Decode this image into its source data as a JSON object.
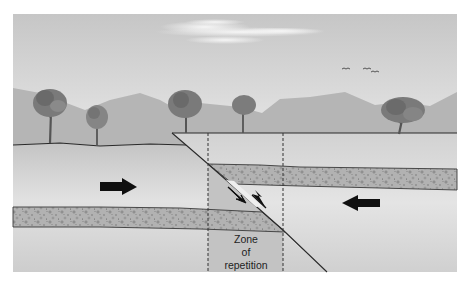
{
  "diagram": {
    "labels": {
      "zone_line1": "Zone",
      "zone_line2": "of",
      "zone_line3": "repetition"
    },
    "arrows": [
      {
        "name": "compression-arrow-right",
        "direction": "right"
      },
      {
        "name": "compression-arrow-left",
        "direction": "left"
      }
    ],
    "fault_motion_arrows": [
      "down-left (lower block)",
      "up-right (upper block)"
    ],
    "scene_elements": [
      "sky",
      "cloud",
      "birds",
      "mountains",
      "trees",
      "ground",
      "sandstone-layer-footwall",
      "sandstone-layer-hanging-wall",
      "thrust-fault",
      "zone-boundary-dashed-lines"
    ],
    "colors": {
      "sky_top": "#c8c8c8",
      "sky_bottom": "#e6e6e6",
      "mountain": "#b4b4b4",
      "ground_top": "#c9c9c9",
      "ground_mid": "#dcdcdc",
      "zone": "#c2c2c2",
      "stipple": "#a9a9a9",
      "line": "#2a2a2a",
      "arrow": "#111111"
    }
  }
}
